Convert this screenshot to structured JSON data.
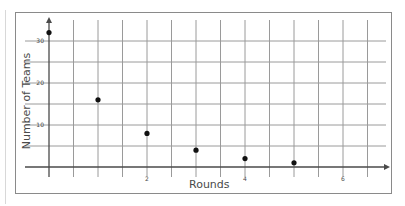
{
  "chart_data": {
    "type": "scatter",
    "title": "",
    "xlabel": "Rounds",
    "ylabel": "Number of Teams",
    "x": [
      0,
      1,
      2,
      3,
      4,
      5
    ],
    "values": [
      32,
      16,
      8,
      4,
      2,
      1
    ],
    "series": [
      {
        "name": "Teams",
        "x": [
          0,
          1,
          2,
          3,
          4,
          5
        ],
        "values": [
          32,
          16,
          8,
          4,
          2,
          1
        ]
      }
    ],
    "x_ticks": [
      2,
      4,
      6
    ],
    "y_ticks": [
      10,
      20,
      30
    ],
    "xlim": [
      0,
      6.5
    ],
    "ylim": [
      0,
      34
    ],
    "grid": true,
    "x_grid_step": 0.5,
    "y_grid_step": 5,
    "legend": "none"
  },
  "labels": {
    "x_axis": "Rounds",
    "y_axis": "Number of Teams",
    "x_tick_labels": [
      "2",
      "4",
      "6"
    ],
    "y_tick_labels": [
      "10",
      "20",
      "30"
    ]
  },
  "colors": {
    "grid": "#9a9a9a",
    "axis": "#4a4a4a",
    "point": "#111111",
    "frame": "#8a8a8a",
    "text": "#4a4a4a"
  }
}
